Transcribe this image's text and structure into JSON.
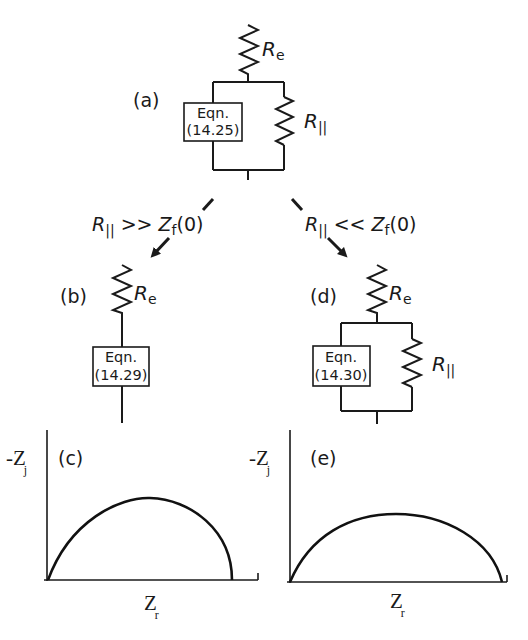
{
  "figure": {
    "panel_a": {
      "label": "(a)",
      "series_resistor": {
        "symbol": "R",
        "subscript": "e"
      },
      "element_box": {
        "line1": "Eqn.",
        "line2": "(14.25)"
      },
      "parallel_resistor": {
        "symbol": "R",
        "subscript": "||"
      }
    },
    "branches": {
      "left_condition": {
        "lhs_symbol": "R",
        "lhs_sub": "||",
        "operator": " >> ",
        "rhs_symbol": "Z",
        "rhs_sub": "f",
        "rhs_arg": "(0)"
      },
      "right_condition": {
        "lhs_symbol": "R",
        "lhs_sub": "||",
        "operator": " << ",
        "rhs_symbol": "Z",
        "rhs_sub": "f",
        "rhs_arg": "(0)"
      }
    },
    "panel_b": {
      "label": "(b)",
      "series_resistor": {
        "symbol": "R",
        "subscript": "e"
      },
      "element_box": {
        "line1": "Eqn.",
        "line2": "(14.29)"
      }
    },
    "panel_d": {
      "label": "(d)",
      "series_resistor": {
        "symbol": "R",
        "subscript": "e"
      },
      "element_box": {
        "line1": "Eqn.",
        "line2": "(14.30)"
      },
      "parallel_resistor": {
        "symbol": "R",
        "subscript": "||"
      }
    },
    "panel_c": {
      "label": "(c)",
      "y_axis": {
        "main": "-Z",
        "sub": "j"
      },
      "x_axis": {
        "main": "Z",
        "sub": "r"
      },
      "curve": "depressed-semicircle"
    },
    "panel_e": {
      "label": "(e)",
      "y_axis": {
        "main": "-Z",
        "sub": "j"
      },
      "x_axis": {
        "main": "Z",
        "sub": "r"
      },
      "curve": "flattened-semicircle"
    }
  }
}
